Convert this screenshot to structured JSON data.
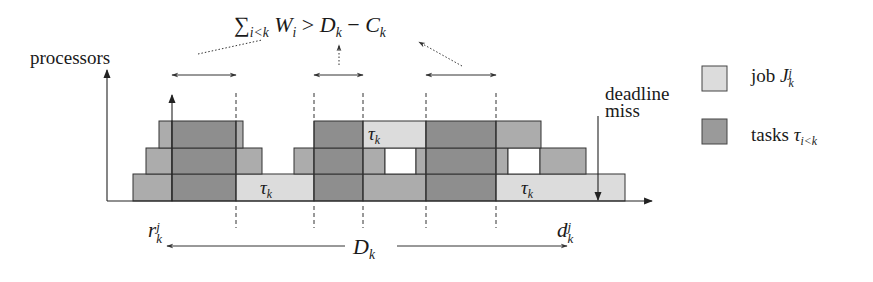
{
  "figure": {
    "y_axis_label": "processors",
    "formula": {
      "sum_symbol": "∑",
      "sum_sub": "i<k",
      "W": "W",
      "W_sub": "i",
      "relation": ">",
      "D": "D",
      "D_sub": "k",
      "minus": "−",
      "C": "C",
      "C_sub": "k"
    },
    "deadline_miss_label_line1": "deadline",
    "deadline_miss_label_line2": "miss",
    "release": {
      "base": "r",
      "sub": "k",
      "sup": "j"
    },
    "deadline": {
      "base": "d",
      "sub": "k",
      "sup": "j"
    },
    "span_label": {
      "base": "D",
      "sub": "k"
    },
    "block_labels": [
      {
        "text": "τ",
        "sub": "k",
        "x": 268,
        "y": 197
      },
      {
        "text": "τ",
        "sub": "k",
        "x": 376,
        "y": 143
      },
      {
        "text": "τ",
        "sub": "k",
        "x": 529,
        "y": 197
      }
    ]
  },
  "legend": {
    "items": [
      {
        "label_prefix": "job ",
        "symbol": "J",
        "sub": "k",
        "sup": "j",
        "color": "#dcdcdc"
      },
      {
        "label_prefix": "tasks ",
        "symbol": "τ",
        "sub": "i<k",
        "sup": "",
        "color": "#9a9a9a"
      }
    ]
  },
  "colors": {
    "job": "#dcdcdc",
    "task_dark": "#8e8e8e",
    "task_mid": "#acacac",
    "stroke": "#333333",
    "background": "#ffffff"
  },
  "chart_data": {
    "type": "diagram",
    "xlabel": "time (release r_k^j to deadline d_k^j, span D_k)",
    "ylabel": "processors",
    "rows": [
      {
        "level": 1,
        "segments": [
          {
            "x0": 133,
            "x1": 172,
            "kind": "task_mid"
          },
          {
            "x0": 172,
            "x1": 236,
            "kind": "task_dark"
          },
          {
            "x0": 236,
            "x1": 314,
            "kind": "job",
            "label": "τ_k"
          },
          {
            "x0": 314,
            "x1": 363,
            "kind": "task_dark"
          },
          {
            "x0": 363,
            "x1": 426,
            "kind": "task_mid"
          },
          {
            "x0": 426,
            "x1": 496,
            "kind": "task_dark"
          },
          {
            "x0": 496,
            "x1": 625,
            "kind": "job",
            "label": "τ_k"
          }
        ]
      },
      {
        "level": 2,
        "segments": [
          {
            "x0": 146,
            "x1": 172,
            "kind": "task_mid"
          },
          {
            "x0": 172,
            "x1": 236,
            "kind": "task_dark"
          },
          {
            "x0": 236,
            "x1": 262,
            "kind": "task_mid"
          },
          {
            "x0": 294,
            "x1": 314,
            "kind": "task_mid"
          },
          {
            "x0": 314,
            "x1": 363,
            "kind": "task_dark"
          },
          {
            "x0": 363,
            "x1": 385,
            "kind": "task_mid"
          },
          {
            "x0": 385,
            "x1": 416,
            "kind": "empty"
          },
          {
            "x0": 416,
            "x1": 426,
            "kind": "task_mid"
          },
          {
            "x0": 426,
            "x1": 496,
            "kind": "task_dark"
          },
          {
            "x0": 496,
            "x1": 508,
            "kind": "task_mid"
          },
          {
            "x0": 508,
            "x1": 540,
            "kind": "empty"
          },
          {
            "x0": 540,
            "x1": 586,
            "kind": "task_mid"
          }
        ]
      },
      {
        "level": 3,
        "segments": [
          {
            "x0": 159,
            "x1": 172,
            "kind": "task_mid"
          },
          {
            "x0": 172,
            "x1": 236,
            "kind": "task_dark"
          },
          {
            "x0": 236,
            "x1": 243,
            "kind": "task_mid"
          },
          {
            "x0": 314,
            "x1": 363,
            "kind": "task_dark"
          },
          {
            "x0": 363,
            "x1": 426,
            "kind": "job",
            "label": "τ_k"
          },
          {
            "x0": 426,
            "x1": 496,
            "kind": "task_dark"
          },
          {
            "x0": 496,
            "x1": 541,
            "kind": "task_mid"
          }
        ]
      }
    ],
    "interference_intervals": [
      {
        "x0": 172,
        "x1": 236
      },
      {
        "x0": 314,
        "x1": 363
      },
      {
        "x0": 426,
        "x1": 496
      }
    ],
    "legend": [
      "job J_k^j",
      "tasks τ_{i<k}"
    ]
  }
}
